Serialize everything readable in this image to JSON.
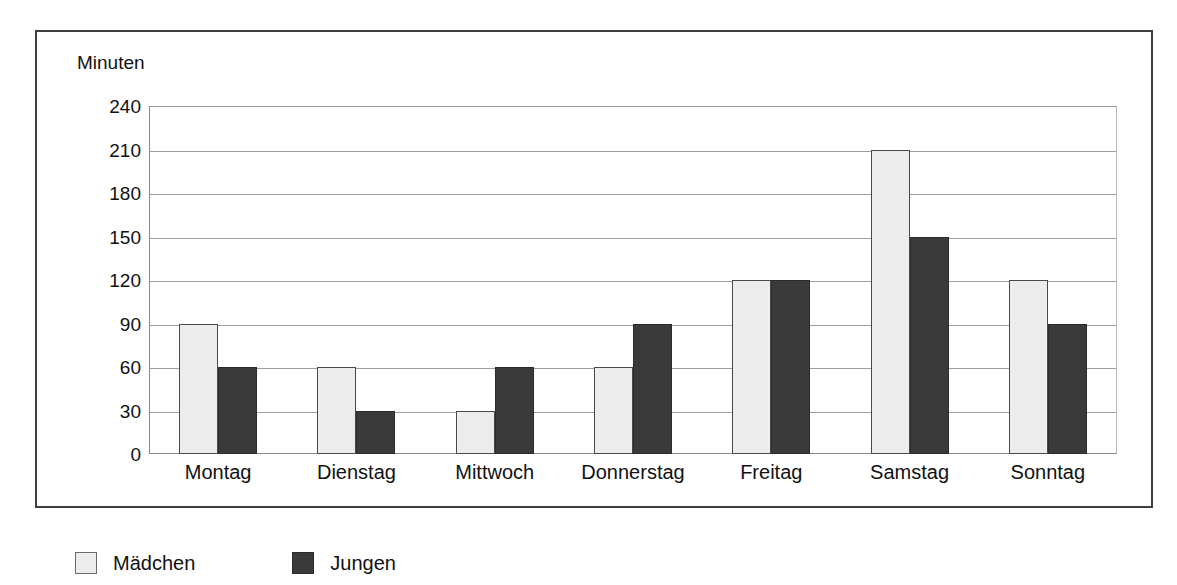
{
  "chart_data": {
    "type": "bar",
    "title": "",
    "subtitle": "",
    "xlabel": "",
    "ylabel": "Minuten",
    "ylim": [
      0,
      240
    ],
    "ytick_step": 30,
    "yticks": [
      240,
      210,
      180,
      150,
      120,
      90,
      60,
      30,
      0
    ],
    "grid": true,
    "legend_position": "below-left",
    "categories": [
      "Montag",
      "Dienstag",
      "Mittwoch",
      "Donnerstag",
      "Freitag",
      "Samstag",
      "Sonntag"
    ],
    "series": [
      {
        "name": "Mädchen",
        "color": "#ececec",
        "values": [
          90,
          60,
          30,
          60,
          120,
          210,
          120
        ]
      },
      {
        "name": "Jungen",
        "color": "#3a3a3a",
        "values": [
          60,
          30,
          60,
          90,
          120,
          150,
          90
        ]
      }
    ]
  },
  "axis": {
    "unit_label": "Minuten"
  },
  "legend": {
    "items": [
      {
        "label": "Mädchen",
        "swatch": "legend-swatch-girls"
      },
      {
        "label": "Jungen",
        "swatch": "legend-swatch-boys"
      }
    ]
  },
  "colors": {
    "girls_fill": "#ececec",
    "boys_fill": "#3a3a3a",
    "gridline": "#9d9d9d",
    "frame_border": "#3f3f3f",
    "text": "#111111"
  }
}
